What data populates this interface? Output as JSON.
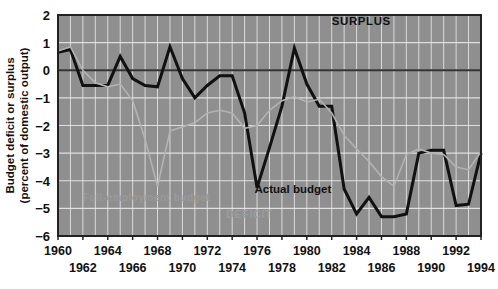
{
  "chart_data": {
    "type": "line",
    "title": "",
    "xlabel": "",
    "ylabel": "Budget deficit or surplus (percent of domestic output)",
    "ylabel_line1": "Budget deficit or surplus",
    "ylabel_line2": "(percent of domestic output)",
    "xlim": [
      1960,
      1994
    ],
    "ylim": [
      -6,
      2
    ],
    "yticks": [
      "2",
      "1",
      "0",
      "-1",
      "-2",
      "-3",
      "-4",
      "-5",
      "-6"
    ],
    "ytick_values": [
      2,
      1,
      0,
      -1,
      -2,
      -3,
      -4,
      -5,
      -6
    ],
    "xticks_top_row": [
      "1960",
      "1964",
      "1968",
      "1972",
      "1976",
      "1980",
      "1984",
      "1988",
      "1992"
    ],
    "xticks_bottom_row": [
      "1962",
      "1966",
      "1970",
      "1974",
      "1978",
      "1982",
      "1986",
      "1990",
      "1994"
    ],
    "xtick_values_top": [
      1960,
      1964,
      1968,
      1972,
      1976,
      1980,
      1984,
      1988,
      1992
    ],
    "xtick_values_bottom": [
      1962,
      1966,
      1970,
      1974,
      1978,
      1982,
      1986,
      1990,
      1994
    ],
    "grid": true,
    "grid_color": "#e8e8e8",
    "plot_bg": "#8f8f8f",
    "legend_position": "inline-annotations",
    "annotations": [
      {
        "name": "surplus",
        "text": "SURPLUS",
        "x": 1982,
        "y": 1.62,
        "style": "dark"
      },
      {
        "name": "deficit",
        "text": "DEFICIT",
        "x": 1973.5,
        "y": -5.35,
        "style": "faint"
      },
      {
        "name": "actual-budget",
        "text": "Actual budget",
        "x": 1975.8,
        "y": -4.45,
        "style": "dark"
      },
      {
        "name": "full-employment-budget",
        "text": "Full-employment budget",
        "x": 1962.0,
        "y": -4.72,
        "style": "faint"
      }
    ],
    "series": [
      {
        "name": "Actual budget",
        "color": "#111111",
        "width": 3.0,
        "x": [
          1960,
          1961,
          1962,
          1963,
          1964,
          1965,
          1966,
          1967,
          1968,
          1969,
          1970,
          1971,
          1972,
          1973,
          1974,
          1975,
          1976,
          1977,
          1978,
          1979,
          1980,
          1981,
          1982,
          1983,
          1984,
          1985,
          1986,
          1987,
          1988,
          1989,
          1990,
          1991,
          1992,
          1993,
          1994
        ],
        "values": [
          0.65,
          0.75,
          -0.55,
          -0.55,
          -0.55,
          0.5,
          -0.3,
          -0.55,
          -0.6,
          0.85,
          -0.3,
          -1.0,
          -0.55,
          -0.2,
          -0.2,
          -1.55,
          -4.25,
          -2.8,
          -1.3,
          0.8,
          -0.5,
          -1.3,
          -1.3,
          -4.3,
          -5.2,
          -4.6,
          -5.3,
          -5.3,
          -5.2,
          -3.0,
          -2.9,
          -2.9,
          -4.9,
          -4.85,
          -3.0
        ]
      },
      {
        "name": "Full-employment budget",
        "color": "#b3b3b3",
        "width": 1.6,
        "x": [
          1960,
          1961,
          1962,
          1963,
          1964,
          1965,
          1966,
          1967,
          1968,
          1969,
          1970,
          1971,
          1972,
          1973,
          1974,
          1975,
          1976,
          1977,
          1978,
          1979,
          1980,
          1981,
          1982,
          1983,
          1984,
          1985,
          1986,
          1987,
          1988,
          1989,
          1990,
          1991,
          1992,
          1993,
          1994
        ],
        "values": [
          0.7,
          0.85,
          0.0,
          -0.45,
          -0.6,
          -0.5,
          -1.1,
          -2.5,
          -4.2,
          -2.2,
          -2.05,
          -1.9,
          -1.55,
          -1.45,
          -1.55,
          -2.1,
          -2.0,
          -1.45,
          -1.1,
          -0.95,
          -1.15,
          -1.05,
          -1.55,
          -2.35,
          -2.85,
          -3.3,
          -3.85,
          -4.2,
          -3.05,
          -2.85,
          -3.0,
          -3.05,
          -3.5,
          -3.6,
          -2.95
        ]
      }
    ]
  },
  "axes": {
    "zero_line_color": "#333333",
    "frame_color": "#222222"
  }
}
